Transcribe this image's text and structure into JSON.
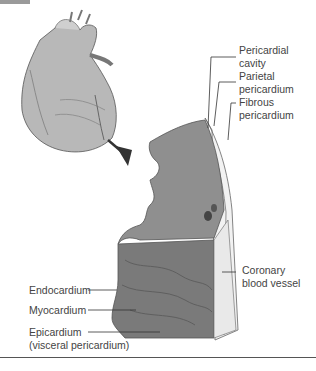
{
  "figure": {
    "labels": {
      "pericardial_cavity": [
        "Pericardial",
        "cavity"
      ],
      "parietal_pericardium": [
        "Parietal",
        "pericardium"
      ],
      "fibrous_pericardium": [
        "Fibrous",
        "pericardium"
      ],
      "coronary_blood_vessel": [
        "Coronary",
        "blood vessel"
      ],
      "endocardium": [
        "Endocardium"
      ],
      "myocardium": [
        "Myocardium"
      ],
      "epicardium": [
        "Epicardium",
        "(visceral pericardium)"
      ]
    },
    "colors": {
      "line": "#333333",
      "text": "#444444",
      "tissue_dark": "#6e6e6e",
      "tissue_mid": "#9a9a9a",
      "tissue_light": "#e6e6e6"
    }
  }
}
